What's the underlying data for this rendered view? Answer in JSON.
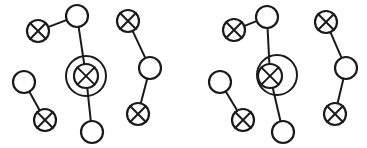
{
  "canvas": {
    "width": 367,
    "height": 148,
    "background_color": "#ffffff",
    "stroke_color": "#1a1a1a"
  },
  "diagram": {
    "type": "node-link-graph",
    "node_styles": {
      "open": "open-circle",
      "crossed": "crossed-circle",
      "crossed_highlighted": "crossed-circle-with-ring"
    },
    "groups": [
      {
        "id": "group-left",
        "name": "left-graph",
        "nodes": [
          {
            "id": "L-a",
            "label": "",
            "style": "crossed",
            "cx": 38,
            "cy": 31,
            "r": 11
          },
          {
            "id": "L-b",
            "label": "",
            "style": "open",
            "cx": 77,
            "cy": 16,
            "r": 11
          },
          {
            "id": "L-c",
            "label": "",
            "style": "crossed_highlighted",
            "cx": 86,
            "cy": 76,
            "r": 12,
            "ring_r": 20,
            "ring_cx": 86,
            "ring_cy": 76
          },
          {
            "id": "L-d",
            "label": "",
            "style": "open",
            "cx": 92,
            "cy": 132,
            "r": 11
          },
          {
            "id": "L-e",
            "label": "",
            "style": "open",
            "cx": 24,
            "cy": 82,
            "r": 11
          },
          {
            "id": "L-f",
            "label": "",
            "style": "crossed",
            "cx": 45,
            "cy": 120,
            "r": 11
          },
          {
            "id": "L-g",
            "label": "",
            "style": "crossed",
            "cx": 128,
            "cy": 21,
            "r": 11
          },
          {
            "id": "L-h",
            "label": "",
            "style": "open",
            "cx": 150,
            "cy": 68,
            "r": 11
          },
          {
            "id": "L-i",
            "label": "",
            "style": "crossed",
            "cx": 138,
            "cy": 114,
            "r": 11
          }
        ],
        "edges": [
          {
            "from": "L-a",
            "to": "L-b"
          },
          {
            "from": "L-b",
            "to": "L-c"
          },
          {
            "from": "L-c",
            "to": "L-d"
          },
          {
            "from": "L-e",
            "to": "L-f"
          },
          {
            "from": "L-g",
            "to": "L-h"
          },
          {
            "from": "L-h",
            "to": "L-i"
          }
        ]
      },
      {
        "id": "group-right",
        "name": "right-graph",
        "nodes": [
          {
            "id": "R-a",
            "label": "",
            "style": "crossed",
            "cx": 234,
            "cy": 30,
            "r": 11
          },
          {
            "id": "R-b",
            "label": "",
            "style": "open",
            "cx": 267,
            "cy": 17,
            "r": 11
          },
          {
            "id": "R-c",
            "label": "",
            "style": "crossed_highlighted",
            "cx": 270,
            "cy": 76,
            "r": 12,
            "ring_r": 20,
            "ring_cx": 277,
            "ring_cy": 75
          },
          {
            "id": "R-d",
            "label": "",
            "style": "open",
            "cx": 283,
            "cy": 132,
            "r": 11
          },
          {
            "id": "R-e",
            "label": "",
            "style": "open",
            "cx": 220,
            "cy": 82,
            "r": 11
          },
          {
            "id": "R-f",
            "label": "",
            "style": "crossed",
            "cx": 243,
            "cy": 120,
            "r": 11
          },
          {
            "id": "R-g",
            "label": "",
            "style": "crossed",
            "cx": 326,
            "cy": 22,
            "r": 11
          },
          {
            "id": "R-h",
            "label": "",
            "style": "open",
            "cx": 346,
            "cy": 68,
            "r": 11
          },
          {
            "id": "R-i",
            "label": "",
            "style": "crossed",
            "cx": 335,
            "cy": 114,
            "r": 11
          }
        ],
        "edges": [
          {
            "from": "R-a",
            "to": "R-b"
          },
          {
            "from": "R-b",
            "to": "R-c"
          },
          {
            "from": "R-c",
            "to": "R-d"
          },
          {
            "from": "R-e",
            "to": "R-f"
          },
          {
            "from": "R-g",
            "to": "R-h"
          },
          {
            "from": "R-h",
            "to": "R-i"
          }
        ]
      }
    ]
  }
}
